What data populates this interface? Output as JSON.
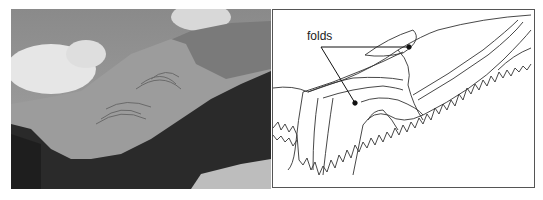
{
  "figure": {
    "photo": {
      "description": "black-and-white photograph of mountain with folded rock strata and forested slope"
    },
    "sketch": {
      "label": "folds",
      "pointers": 2
    }
  }
}
